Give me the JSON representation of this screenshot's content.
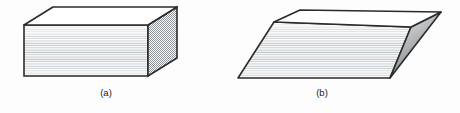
{
  "figure": {
    "background_color": "#fdfdfd",
    "panels": [
      {
        "id": "panel-a",
        "caption": "(a)",
        "caption_x": 106,
        "caption_y": 96,
        "shape_name": "rectangular-block",
        "description": "Rectangular laminated block stack with horizontally striped front face, plain white top face, and stippled right side face",
        "faces": {
          "top": {
            "name": "top-face",
            "points": "24,25 53,7 177,7 148,25",
            "fill": "#ffffff",
            "stroke": "#2b2b2b"
          },
          "front": {
            "name": "front-face",
            "points": "24,25 148,25 148,76 24,76",
            "fill": "#fbfbfb",
            "stroke": "#2b2b2b",
            "pattern": "horizontal-stripes",
            "stripe_color": "#b9bfc2",
            "stripe_spacing_px": 2.3
          },
          "side": {
            "name": "right-side-face",
            "points": "148,25 177,7 177,58 148,76",
            "fill": "#ffffff",
            "stroke": "#2b2b2b",
            "pattern": "stipple-checker",
            "stipple_color": "#8d9296"
          }
        }
      },
      {
        "id": "panel-b",
        "caption": "(b)",
        "caption_x": 322,
        "caption_y": 96,
        "shape_name": "sheared-parallelepiped-block",
        "description": "Sheared (skewed) laminated block stack with horizontally striped front face, plain white top face, and gray gradient right side face",
        "faces": {
          "top": {
            "name": "top-face",
            "points": "274,22 300,10 441,12 411,27",
            "fill": "#ffffff",
            "stroke": "#2b2b2b"
          },
          "front": {
            "name": "front-face",
            "points": "274,22 411,27 390,78 238,78",
            "fill": "#fbfbfb",
            "stroke": "#2b2b2b",
            "pattern": "horizontal-stripes",
            "stripe_color": "#b9bfc2",
            "stripe_spacing_px": 2.3
          },
          "side": {
            "name": "right-side-face",
            "points": "411,27 441,12 390,78",
            "fill": "gradient-gray",
            "stroke": "#2b2b2b",
            "gradient_from": "#f2f2f2",
            "gradient_to": "#6e7276"
          }
        }
      }
    ],
    "line_color": "#2b2b2b",
    "caption_color": "#1b1b1b"
  }
}
